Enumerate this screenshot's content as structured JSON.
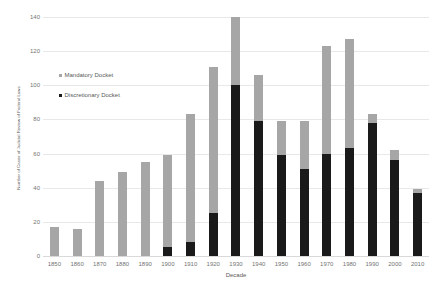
{
  "chart_data": {
    "type": "bar",
    "subtype": "stacked-vertical",
    "title": "",
    "xlabel": "Decade",
    "ylabel": "Number of Cases of Judicial Review of Federal Laws",
    "categories": [
      "1850",
      "1860",
      "1870",
      "1880",
      "1890",
      "1900",
      "1910",
      "1920",
      "1930",
      "1940",
      "1950",
      "1960",
      "1970",
      "1980",
      "1990",
      "2000",
      "2010"
    ],
    "series": [
      {
        "name": "Discretionary Docket",
        "color": "#1a1a1a",
        "values": [
          0,
          0,
          0,
          0,
          0,
          5,
          8,
          25,
          100,
          79,
          59,
          51,
          60,
          63,
          78,
          56,
          37
        ]
      },
      {
        "name": "Mandatory Docket",
        "color": "#a6a6a6",
        "values": [
          17,
          16,
          44,
          49,
          55,
          54,
          75,
          86,
          40,
          27,
          20,
          28,
          63,
          64,
          5,
          6,
          2
        ]
      }
    ],
    "totals": [
      17,
      16,
      44,
      49,
      55,
      59,
      83,
      111,
      140,
      106,
      79,
      79,
      123,
      127,
      83,
      62,
      39
    ],
    "ylim": [
      0,
      140
    ],
    "yticks": [
      0,
      20,
      40,
      60,
      80,
      100,
      120,
      140
    ],
    "ytick_labels": [
      "0",
      "20",
      "40",
      "60",
      "80",
      "100",
      "120",
      "140"
    ],
    "grid": true,
    "legend_position": "inside-upper-left",
    "background": "#ffffff",
    "gridline_color": "#e8e8e8"
  },
  "legend": {
    "items": [
      {
        "label": "Mandatory Docket",
        "swatch": "mandatory-swatch"
      },
      {
        "label": "Discretionary Docket",
        "swatch": "discretionary-swatch"
      }
    ]
  },
  "axes": {
    "x_title": "Decade",
    "y_title": "Number of Cases of Judicial Review of Federal Laws"
  }
}
